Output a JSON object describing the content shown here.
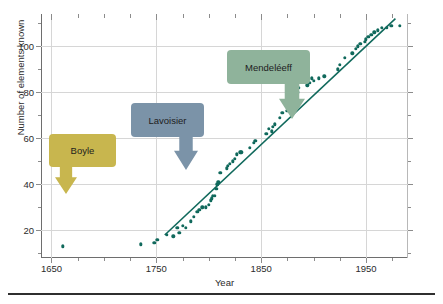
{
  "chart_data": {
    "type": "scatter",
    "title": "",
    "xlabel": "Year",
    "ylabel": "Number of elements known",
    "xlim": [
      1640,
      1990
    ],
    "ylim": [
      8,
      114
    ],
    "x_ticks": [
      1650,
      1750,
      1850,
      1950
    ],
    "x_tick_labels": [
      "1650",
      "1750",
      "1850",
      "1950"
    ],
    "x_minor_step": 25,
    "y_ticks": [
      20,
      40,
      60,
      80,
      100
    ],
    "y_tick_labels": [
      "20",
      "40",
      "60",
      "80",
      "100"
    ],
    "y_minor_step": 10,
    "grid": true,
    "legend": "none",
    "point_color": "#10695c",
    "line_color": "#10695c",
    "points": [
      [
        1661,
        13
      ],
      [
        1735,
        14
      ],
      [
        1748,
        14.5
      ],
      [
        1751,
        16
      ],
      [
        1760,
        18
      ],
      [
        1766,
        17.5
      ],
      [
        1770,
        21
      ],
      [
        1772,
        19
      ],
      [
        1775,
        22
      ],
      [
        1778,
        21
      ],
      [
        1783,
        24
      ],
      [
        1786,
        26
      ],
      [
        1789,
        28
      ],
      [
        1791,
        29
      ],
      [
        1794,
        30
      ],
      [
        1797,
        30
      ],
      [
        1800,
        31
      ],
      [
        1802,
        33
      ],
      [
        1803,
        34
      ],
      [
        1804,
        35
      ],
      [
        1806,
        35
      ],
      [
        1807,
        38
      ],
      [
        1808,
        40
      ],
      [
        1809,
        41
      ],
      [
        1811,
        45
      ],
      [
        1817,
        47
      ],
      [
        1818,
        48
      ],
      [
        1820,
        49
      ],
      [
        1823,
        50
      ],
      [
        1825,
        51
      ],
      [
        1827,
        53
      ],
      [
        1830,
        54
      ],
      [
        1831,
        54
      ],
      [
        1839,
        56
      ],
      [
        1843,
        58
      ],
      [
        1844,
        59
      ],
      [
        1845,
        59
      ],
      [
        1855,
        62
      ],
      [
        1857,
        64
      ],
      [
        1860,
        63
      ],
      [
        1861,
        65
      ],
      [
        1863,
        66
      ],
      [
        1868,
        69
      ],
      [
        1870,
        71
      ],
      [
        1875,
        72
      ],
      [
        1878,
        74
      ],
      [
        1879,
        76
      ],
      [
        1880,
        78
      ],
      [
        1885,
        80
      ],
      [
        1886,
        82
      ],
      [
        1894,
        83
      ],
      [
        1896,
        84
      ],
      [
        1898,
        86
      ],
      [
        1900,
        85
      ],
      [
        1905,
        86
      ],
      [
        1910,
        87
      ],
      [
        1923,
        90
      ],
      [
        1925,
        92
      ],
      [
        1930,
        95
      ],
      [
        1937,
        97
      ],
      [
        1940,
        99
      ],
      [
        1942,
        100
      ],
      [
        1944,
        101
      ],
      [
        1945,
        101
      ],
      [
        1949,
        102
      ],
      [
        1950,
        103
      ],
      [
        1952,
        104
      ],
      [
        1955,
        105
      ],
      [
        1958,
        106
      ],
      [
        1961,
        107
      ],
      [
        1965,
        108
      ],
      [
        1970,
        108
      ],
      [
        1974,
        109
      ],
      [
        1982,
        109
      ]
    ],
    "trend_line": {
      "x_start": 1758,
      "y_start": 18,
      "x_end": 1978,
      "y_end": 112
    },
    "annotations": [
      {
        "label": "Boyle",
        "box_color": "#c8b64e",
        "text_color": "#1d1d1d",
        "arrow_side": "left",
        "points_to_year": 1661
      },
      {
        "label": "Lavoisier",
        "box_color": "#7b93a8",
        "text_color": "#1d1d1d",
        "arrow_side": "right",
        "points_to_year": 1789
      },
      {
        "label": "Mendeléeff",
        "box_color": "#8fb39b",
        "text_color": "#1d1d1d",
        "arrow_side": "right",
        "points_to_year": 1869
      }
    ]
  },
  "figure": {
    "background": "#ffffff",
    "grid_color": "#d6d6d6",
    "axis_color": "#6e6e6e"
  }
}
